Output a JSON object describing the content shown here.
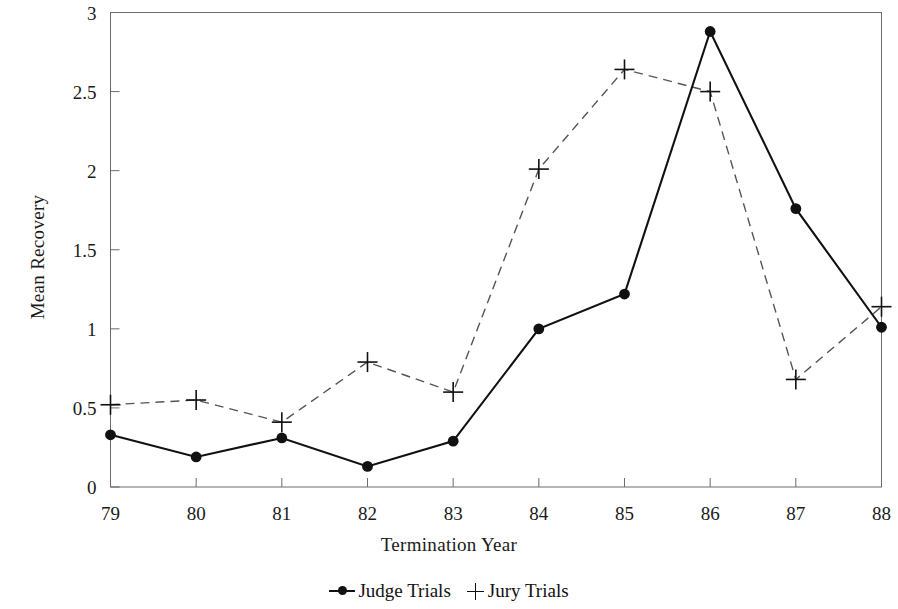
{
  "chart_data": {
    "type": "line",
    "title": "",
    "xlabel": "Termination Year",
    "ylabel": "Mean Recovery",
    "categories": [
      "79",
      "80",
      "81",
      "82",
      "83",
      "84",
      "85",
      "86",
      "87",
      "88"
    ],
    "xlim": [
      79,
      88
    ],
    "ylim": [
      0,
      3
    ],
    "yticks": [
      "0",
      "0.5",
      "1",
      "1.5",
      "2",
      "2.5",
      "3"
    ],
    "ytick_values": [
      0,
      0.5,
      1,
      1.5,
      2,
      2.5,
      3
    ],
    "grid": false,
    "legend_position": "bottom-center",
    "series": [
      {
        "name": "Judge Trials",
        "marker": "filled-circle",
        "line_style": "solid",
        "color": "#111111",
        "values": [
          0.33,
          0.19,
          0.31,
          0.13,
          0.29,
          1.0,
          1.22,
          2.88,
          1.76,
          1.01
        ]
      },
      {
        "name": "Jury Trials",
        "marker": "plus",
        "line_style": "dashed",
        "color": "#555555",
        "values": [
          0.52,
          0.55,
          0.41,
          0.79,
          0.6,
          2.01,
          2.64,
          2.5,
          0.68,
          1.14
        ]
      }
    ]
  },
  "legend": {
    "items": [
      {
        "label": "Judge Trials",
        "marker_name": "judge-line-dot-marker"
      },
      {
        "label": "Jury Trials",
        "marker_name": "jury-plus-marker"
      }
    ]
  },
  "colors": {
    "axis": "#5a5a5a",
    "judge_series": "#111111",
    "jury_series": "#555555",
    "text": "#1a1a1a",
    "background": "#ffffff"
  }
}
